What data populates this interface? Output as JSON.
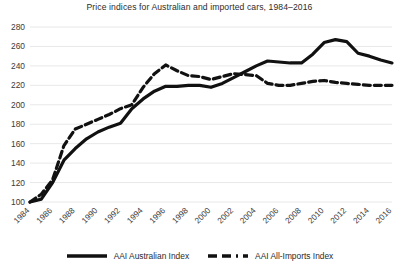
{
  "chart_data": {
    "type": "line",
    "title": "Price indices for Australian and imported cars, 1984–2016",
    "xlabel": "",
    "ylabel": "",
    "xlim": [
      1984,
      2016
    ],
    "ylim": [
      100,
      280
    ],
    "ytick_step": 20,
    "grid": "horizontal",
    "legend_position": "bottom",
    "yticks": [
      280,
      260,
      240,
      220,
      200,
      180,
      160,
      140,
      120,
      100
    ],
    "xticks": [
      1984,
      1986,
      1988,
      1990,
      1992,
      1994,
      1996,
      1998,
      2000,
      2002,
      2004,
      2006,
      2008,
      2010,
      2012,
      2014,
      2016
    ],
    "x": [
      1984,
      1985,
      1986,
      1987,
      1988,
      1989,
      1990,
      1991,
      1992,
      1993,
      1994,
      1995,
      1996,
      1997,
      1998,
      1999,
      2000,
      2001,
      2002,
      2003,
      2004,
      2005,
      2006,
      2007,
      2008,
      2009,
      2010,
      2011,
      2012,
      2013,
      2014,
      2015,
      2016
    ],
    "series": [
      {
        "name": "AAI Australian Index",
        "style": "solid",
        "color": "#111111",
        "values": [
          100,
          103,
          120,
          143,
          155,
          165,
          172,
          177,
          181,
          196,
          206,
          214,
          219,
          219,
          220,
          220,
          218,
          222,
          228,
          234,
          240,
          245,
          244,
          243,
          243,
          252,
          264,
          267,
          265,
          253,
          250,
          246,
          243
        ]
      },
      {
        "name": "AAI All-Imports Index",
        "style": "dashed",
        "color": "#111111",
        "values": [
          100,
          108,
          123,
          158,
          175,
          180,
          185,
          190,
          196,
          200,
          218,
          232,
          241,
          235,
          230,
          229,
          226,
          229,
          232,
          231,
          230,
          222,
          220,
          220,
          222,
          224,
          225,
          223,
          222,
          221,
          220,
          220,
          220
        ]
      }
    ]
  },
  "legend": {
    "entries": [
      {
        "label": "AAI Australian Index",
        "style": "solid"
      },
      {
        "label": "AAI All-Imports Index",
        "style": "dashed"
      }
    ]
  }
}
